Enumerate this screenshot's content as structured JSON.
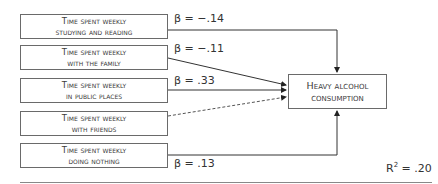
{
  "diagram": {
    "predictors": [
      {
        "line1": "Time spent weekly",
        "line2": "studying and reading",
        "beta": "β = −.14",
        "significant": true
      },
      {
        "line1": "Time spent weekly",
        "line2": "with the family",
        "beta": "β = −.11",
        "significant": true
      },
      {
        "line1": "Time spent weekly",
        "line2": "in public places",
        "beta": "β = .33",
        "significant": true
      },
      {
        "line1": "Time spent weekly",
        "line2": "with friends",
        "beta": "",
        "significant": false
      },
      {
        "line1": "Time spent weekly",
        "line2": "doing nothing",
        "beta": "β = .13",
        "significant": true
      }
    ],
    "outcome": {
      "line1": "Heavy alcohol",
      "line2": "consumption"
    },
    "r2": {
      "label": "R",
      "sup": "2",
      "value": " = .20"
    }
  }
}
